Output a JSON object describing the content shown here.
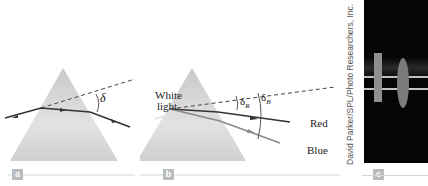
{
  "figure": {
    "panels": [
      {
        "id": "a",
        "badge": "a",
        "angle_label": "δ"
      },
      {
        "id": "b",
        "badge": "b",
        "incident_label_1": "White",
        "incident_label_2": "light",
        "angle_red_label": "δ",
        "angle_red_sub": "R",
        "angle_blue_label": "δ",
        "angle_blue_sub": "B",
        "ray_red_label": "Red",
        "ray_blue_label": "Blue"
      },
      {
        "id": "c",
        "badge": "c",
        "credit": "David Parker/SPL/Photo Researchers, Inc."
      }
    ],
    "colors": {
      "prism": "#d9d9d9",
      "ray": "#333333",
      "ray_white": "#e4e4e4",
      "ray_blue": "#8a8a8a",
      "photo_bg": "#050505",
      "badge": "#b9bcbf",
      "rule": "#d6d6d6"
    }
  }
}
